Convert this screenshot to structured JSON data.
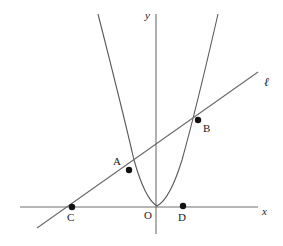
{
  "figure": {
    "background_color": "#ffffff",
    "width": 283,
    "height": 246,
    "axes": {
      "x_axis_label": "x",
      "y_axis_label": "y",
      "origin_label": "O",
      "axis_color": "#6e6e6e",
      "x_axis": {
        "x1": 20,
        "y1": 207,
        "x2": 258,
        "y2": 207
      },
      "y_axis": {
        "x1": 156,
        "y1": 14,
        "x2": 156,
        "y2": 234
      },
      "origin": {
        "x": 156,
        "y": 207
      }
    },
    "curve": {
      "name": "parabola",
      "color": "#5a5a5a",
      "vertex": {
        "x": 157,
        "y": 206
      },
      "left_end": {
        "x": 98,
        "y": 14
      },
      "right_end": {
        "x": 218,
        "y": 14
      },
      "path": "M 98,14 Q 122.5,110 134,160 Q 145,199 157,206 Q 170,199 182,160 Q 196,110 218,14"
    },
    "line": {
      "name": "secant-line",
      "label": "ℓ",
      "color": "#6a6a6a",
      "start": {
        "x": 37,
        "y": 228
      },
      "end": {
        "x": 258,
        "y": 72
      },
      "label_position": {
        "x": 264,
        "y": 76
      }
    },
    "points": [
      {
        "id": "A",
        "label": "A",
        "x": 129,
        "y": 170,
        "label_x": 113,
        "label_y": 156,
        "radius": 3.2
      },
      {
        "id": "B",
        "label": "B",
        "x": 198,
        "y": 120,
        "label_x": 203,
        "label_y": 123,
        "radius": 3.2
      },
      {
        "id": "C",
        "label": "C",
        "x": 72,
        "y": 207,
        "label_x": 67,
        "label_y": 212,
        "radius": 3.2
      },
      {
        "id": "D",
        "label": "D",
        "x": 183,
        "y": 206,
        "label_x": 178,
        "label_y": 212,
        "radius": 3.2
      }
    ]
  },
  "chart_data": {
    "type": "scatter",
    "xlabel": "x",
    "ylabel": "y",
    "grid": false,
    "legend": null,
    "annotations": [
      "A",
      "B",
      "C",
      "D",
      "O",
      "ℓ",
      "x",
      "y"
    ],
    "series": [
      {
        "name": "parabola",
        "kind": "curve"
      },
      {
        "name": "line ℓ",
        "kind": "line"
      },
      {
        "name": "labelled points",
        "kind": "points",
        "labels": [
          "A",
          "B",
          "C",
          "D"
        ]
      }
    ]
  }
}
